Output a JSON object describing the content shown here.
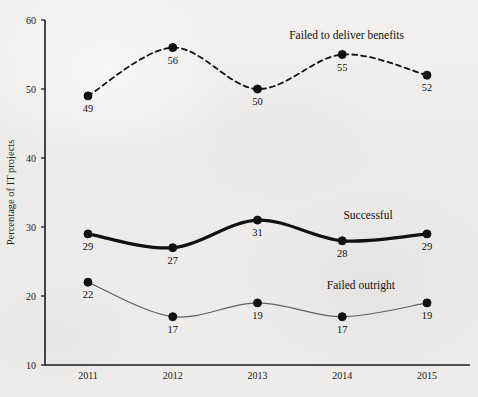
{
  "chart_data": {
    "type": "line",
    "title": "",
    "xlabel": "",
    "ylabel": "Percentage of IT projects",
    "x": [
      "2011",
      "2012",
      "2013",
      "2014",
      "2015"
    ],
    "categories": [
      "2011",
      "2012",
      "2013",
      "2014",
      "2015"
    ],
    "ylim": [
      10,
      60
    ],
    "yticks": [
      "10",
      "20",
      "30",
      "40",
      "50",
      "60"
    ],
    "grid": false,
    "legend_position": "inline-annotations",
    "series": [
      {
        "name": "Failed to deliver benefits",
        "values": [
          49,
          56,
          50,
          55,
          52
        ],
        "style": "dashed",
        "color": "#111111",
        "label_x_pct": 72.5,
        "label_y_pct": 9.7
      },
      {
        "name": "Successful",
        "values": [
          29,
          27,
          31,
          28,
          29
        ],
        "style": "solid-thick",
        "color": "#111111",
        "label_x_pct": 77.0,
        "label_y_pct": 55.2
      },
      {
        "name": "Failed outright",
        "values": [
          22,
          17,
          19,
          17,
          19
        ],
        "style": "solid-thin",
        "color": "#5f5f5f",
        "label_x_pct": 75.5,
        "label_y_pct": 72.8
      }
    ],
    "point_labels": {
      "failed_to_deliver_benefits": [
        "49",
        "56",
        "50",
        "55",
        "52"
      ],
      "successful": [
        "29",
        "27",
        "31",
        "28",
        "29"
      ],
      "failed_outright": [
        "22",
        "17",
        "19",
        "17",
        "19"
      ]
    }
  },
  "axis": {
    "y_title": "Percentage of IT projects",
    "y_ticks": [
      "60",
      "50",
      "40",
      "30",
      "20",
      "10"
    ],
    "x_ticks": [
      "2011",
      "2012",
      "2013",
      "2014",
      "2015"
    ]
  },
  "colors": {
    "background": "#eeedeb",
    "ink": "#111111",
    "gray_line": "#5f5f5f",
    "axis": "#1d1d1d"
  }
}
